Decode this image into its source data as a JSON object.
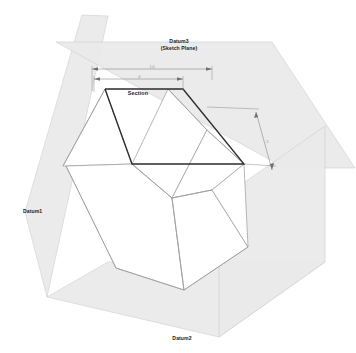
{
  "drawing": {
    "title": "Datum planes and sketch section isometric view",
    "background_color": "#ffffff",
    "plane_fill_color": "#e9e9e9",
    "plane_edge_color": "#cfcfcf",
    "solid_edge_color": "#9a9a9a",
    "section_edge_color": "#2b2b2b",
    "dimension_color": "#7d7d7d"
  },
  "labels": {
    "datum3_line1": "Datum3",
    "datum3_line2": "(Sketch Plane)",
    "datum1": "Datum1",
    "datum2": "Datum2",
    "section": "Section"
  },
  "dimensions": {
    "top_outer": {
      "name": "overall-width-dimension",
      "value": "1.0",
      "x1": 92,
      "x2": 212,
      "y": 69
    },
    "top_inner": {
      "name": "section-width-dimension",
      "value": ".6",
      "x1": 94,
      "x2": 183,
      "y": 79
    },
    "right_side": {
      "name": "depth-dimension",
      "value": ".5",
      "x1": 256,
      "y1": 112,
      "x2": 272,
      "y2": 170
    }
  },
  "geometry": {
    "datum1_plane": "25,212 82,15 108,16 47,297",
    "datum2_plane": "47,297 108,262 325,262 219,337",
    "datum3_plane": "56,42 272,42 355,168 285,168",
    "section_outline": "105,89 183,89 244,164 132,164",
    "solid_faces": [
      "66,166 132,164 244,164 248,247 184,290 116,268",
      "66,166 116,268 184,290 248,247 244,164 132,164"
    ]
  }
}
